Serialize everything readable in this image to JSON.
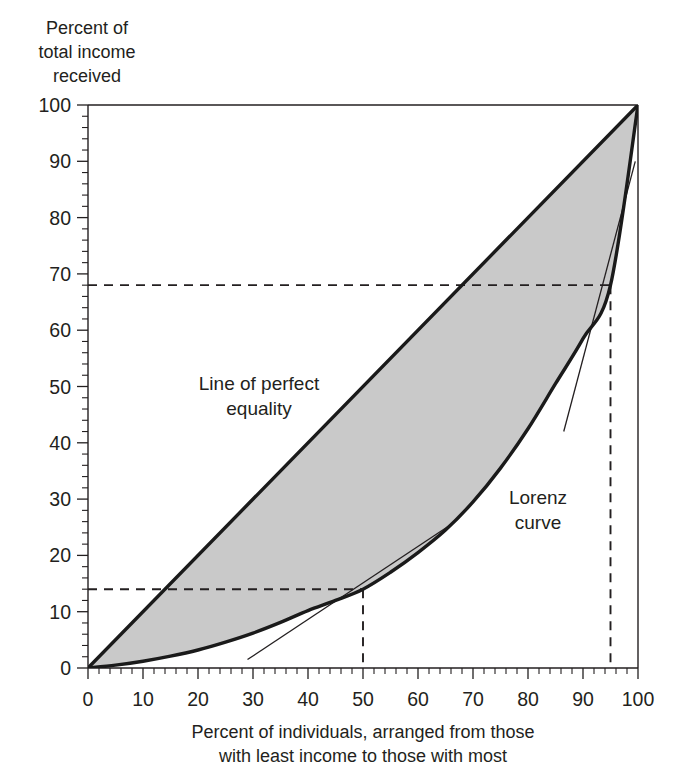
{
  "figure": {
    "y_axis_title_lines": [
      "Percent of",
      "total income",
      "received"
    ],
    "x_axis_title_lines": [
      "Percent of individuals, arranged from those",
      "with least income to those with most"
    ],
    "annotations": {
      "equality_line_label_lines": [
        "Line of perfect",
        "equality"
      ],
      "lorenz_label_lines": [
        "Lorenz",
        "curve"
      ]
    },
    "colors": {
      "ink": "#231f20",
      "curve": "#1a1a1a",
      "fill": "#c9c9c9",
      "background": "#ffffff"
    }
  },
  "chart_data": {
    "type": "line",
    "title": "",
    "xlabel": "Percent of individuals, arranged from those with least income to those with most",
    "ylabel": "Percent of total income received",
    "xlim": [
      0,
      100
    ],
    "ylim": [
      0,
      100
    ],
    "xticks": [
      0,
      10,
      20,
      30,
      40,
      50,
      60,
      70,
      80,
      90,
      100
    ],
    "yticks": [
      0,
      10,
      20,
      30,
      40,
      50,
      60,
      70,
      80,
      90,
      100
    ],
    "x_minor_tick_step": 2,
    "y_minor_tick_step": 2,
    "grid": false,
    "legend": "none",
    "series": [
      {
        "name": "Line of perfect equality",
        "x": [
          0,
          100
        ],
        "values": [
          0,
          100
        ]
      },
      {
        "name": "Lorenz curve",
        "x": [
          0,
          5,
          10,
          15,
          20,
          25,
          30,
          35,
          40,
          45,
          50,
          55,
          60,
          65,
          70,
          75,
          80,
          85,
          90,
          95,
          100
        ],
        "values": [
          0,
          0.5,
          1.2,
          2.1,
          3.2,
          4.6,
          6.2,
          8.1,
          10.2,
          12.0,
          14.0,
          17.0,
          20.5,
          24.5,
          29.5,
          35.5,
          42.5,
          50.5,
          58.5,
          68.0,
          100
        ]
      }
    ],
    "annotations": [
      {
        "name": "reference-point-median",
        "x": 50,
        "y": 14,
        "note": "50 percent of individuals receive 14 percent of total income"
      },
      {
        "name": "reference-point-upper",
        "x": 95,
        "y": 68,
        "note": "95 percent of individuals receive 68 percent of total income"
      }
    ],
    "tangents": [
      {
        "name": "tangent-at-50",
        "x1": 29,
        "y1": 1.5,
        "x2": 66,
        "y2": 25.5
      },
      {
        "name": "tangent-at-95",
        "x1": 86.5,
        "y1": 42.0,
        "x2": 99.5,
        "y2": 90.0
      }
    ]
  }
}
